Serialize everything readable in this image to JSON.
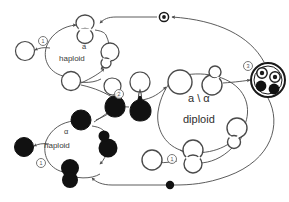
{
  "diagram": {
    "type": "life-cycle-diagram",
    "background_color": "#ffffff",
    "stroke_color": "#4a4a4a",
    "fill_light": "#ffffff",
    "fill_dark": "#111111",
    "text_color": "#3a3a3a"
  },
  "labels": {
    "haploid_a_mating_type": "a",
    "haploid_a_ploidy": "haploid",
    "haploid_alpha_mating_type": "α",
    "haploid_alpha_ploidy": "haploid",
    "diploid_genotype": "a \\ α",
    "diploid_ploidy": "diploid"
  },
  "step_markers": [
    {
      "id": "marker-top-budding-a",
      "label": "①",
      "text": "1"
    },
    {
      "id": "marker-mating",
      "label": "②",
      "text": "2"
    },
    {
      "id": "marker-sporulation",
      "label": "③",
      "text": "3"
    },
    {
      "id": "marker-bottom-budding-alpha",
      "label": "①",
      "text": "1"
    },
    {
      "id": "marker-diploid-budding",
      "label": "①",
      "text": "1"
    }
  ],
  "nodes": [
    {
      "id": "a-single-left",
      "name": "haploid-a-cell",
      "shade": "light",
      "shape": "circle"
    },
    {
      "id": "a-dividing-top",
      "name": "haploid-a-dividing-cell",
      "shade": "light",
      "shape": "dumbbell"
    },
    {
      "id": "a-bud-right",
      "name": "haploid-a-budding-cell",
      "shade": "light",
      "shape": "budding"
    },
    {
      "id": "a-single-bottom",
      "name": "haploid-a-daughter-cell",
      "shade": "light",
      "shape": "circle"
    },
    {
      "id": "a-gamete-1",
      "name": "haploid-a-gamete",
      "shade": "light",
      "shape": "teardrop"
    },
    {
      "id": "a-gamete-2",
      "name": "haploid-a-gamete",
      "shade": "light",
      "shape": "teardrop"
    },
    {
      "id": "alpha-gamete-1",
      "name": "haploid-alpha-gamete",
      "shade": "dark",
      "shape": "teardrop"
    },
    {
      "id": "alpha-gamete-2",
      "name": "haploid-alpha-gamete",
      "shade": "dark",
      "shape": "teardrop"
    },
    {
      "id": "zygote",
      "name": "zygote-cell",
      "shade": "light",
      "shape": "circle"
    },
    {
      "id": "diploid-budding",
      "name": "diploid-budding-cell",
      "shade": "light",
      "shape": "dumbbell"
    },
    {
      "id": "diploid-daughter",
      "name": "diploid-daughter-cell",
      "shade": "light",
      "shape": "circle"
    },
    {
      "id": "diploid-right-bud",
      "name": "diploid-budding-cell-right",
      "shade": "light",
      "shape": "budding"
    },
    {
      "id": "ascus",
      "name": "ascus-with-four-spores",
      "shade": "mixed",
      "shape": "ascus"
    },
    {
      "id": "alpha-single-left",
      "name": "haploid-alpha-cell",
      "shade": "dark",
      "shape": "circle"
    },
    {
      "id": "alpha-dividing-top",
      "name": "haploid-alpha-dividing-cell",
      "shade": "dark",
      "shape": "circle"
    },
    {
      "id": "alpha-bud-right",
      "name": "haploid-alpha-budding-cell",
      "shade": "dark",
      "shape": "budding"
    },
    {
      "id": "alpha-dumbbell",
      "name": "haploid-alpha-dividing-pair",
      "shade": "dark",
      "shape": "dumbbell"
    },
    {
      "id": "alpha-teardrop-up",
      "name": "haploid-alpha-gamete-upper",
      "shade": "dark",
      "shape": "teardrop"
    }
  ],
  "markers": {
    "top_node": {
      "name": "alpha-spore-marker",
      "style": "ringed-dot"
    },
    "bottom_node": {
      "name": "a-spore-marker",
      "style": "solid-dot"
    }
  },
  "spores": [
    {
      "position": "upper-left",
      "type": "ringed-dot"
    },
    {
      "position": "upper-right",
      "type": "ringed-dot"
    },
    {
      "position": "lower-left",
      "type": "solid-dot"
    },
    {
      "position": "lower-right",
      "type": "solid-dot"
    }
  ]
}
